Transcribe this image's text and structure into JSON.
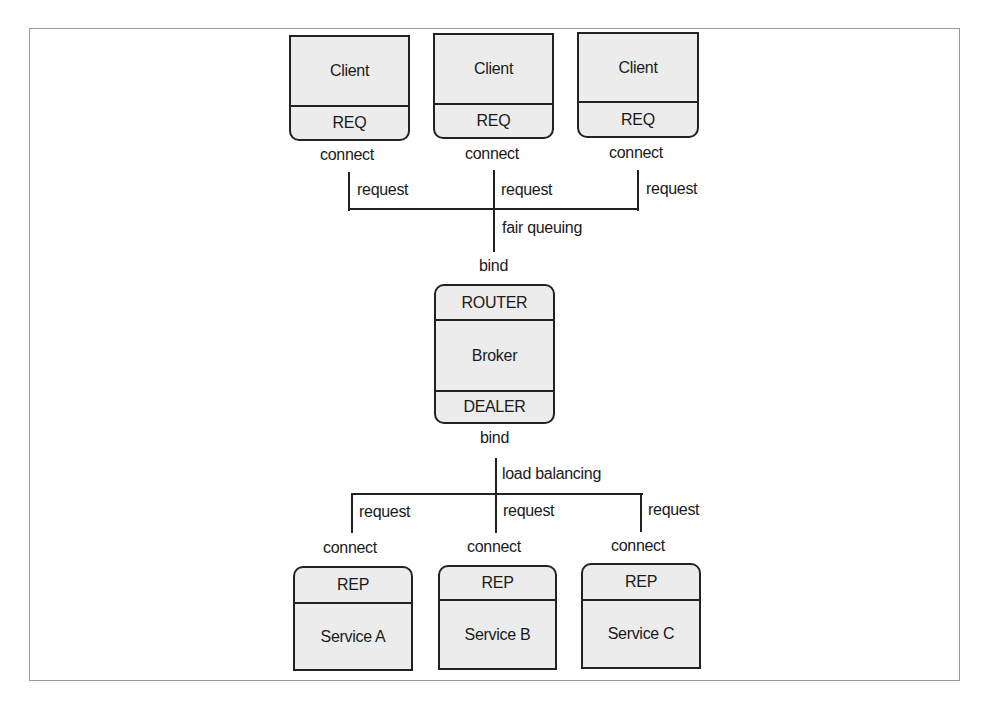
{
  "diagram": {
    "clients": [
      {
        "name": "Client",
        "socket": "REQ",
        "connect_label": "connect",
        "edge_label": "request"
      },
      {
        "name": "Client",
        "socket": "REQ",
        "connect_label": "connect",
        "edge_label": "request"
      },
      {
        "name": "Client",
        "socket": "REQ",
        "connect_label": "connect",
        "edge_label": "request"
      }
    ],
    "front_policy": "fair queuing",
    "broker": {
      "front_socket": "ROUTER",
      "name": "Broker",
      "back_socket": "DEALER",
      "front_bind_label": "bind",
      "back_bind_label": "bind"
    },
    "back_policy": "load balancing",
    "services": [
      {
        "socket": "REP",
        "name": "Service A",
        "connect_label": "connect",
        "edge_label": "request"
      },
      {
        "socket": "REP",
        "name": "Service B",
        "connect_label": "connect",
        "edge_label": "request"
      },
      {
        "socket": "REP",
        "name": "Service C",
        "connect_label": "connect",
        "edge_label": "request"
      }
    ],
    "colors": {
      "fill": "#ececec",
      "stroke": "#222222",
      "frame": "#9a9a9a"
    }
  }
}
